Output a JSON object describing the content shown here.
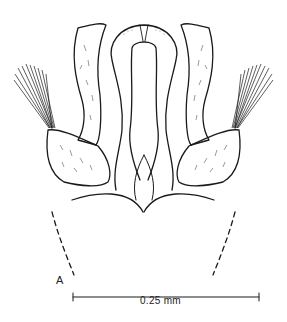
{
  "figure": {
    "type": "scientific line drawing",
    "panel_label": "A",
    "scale_bar": {
      "label": "0.25 mm",
      "x_start": 73,
      "x_end": 259,
      "y": 297
    },
    "colors": {
      "line": "#1a1a1a",
      "background": "#ffffff"
    },
    "parts": [
      "central-median-lobe",
      "inner-median-loop",
      "left-paramere",
      "right-paramere",
      "left-setal-brush",
      "right-setal-brush",
      "left-basal-lobe",
      "right-basal-lobe",
      "central-valve",
      "left-dashed-outline",
      "right-dashed-outline"
    ]
  }
}
